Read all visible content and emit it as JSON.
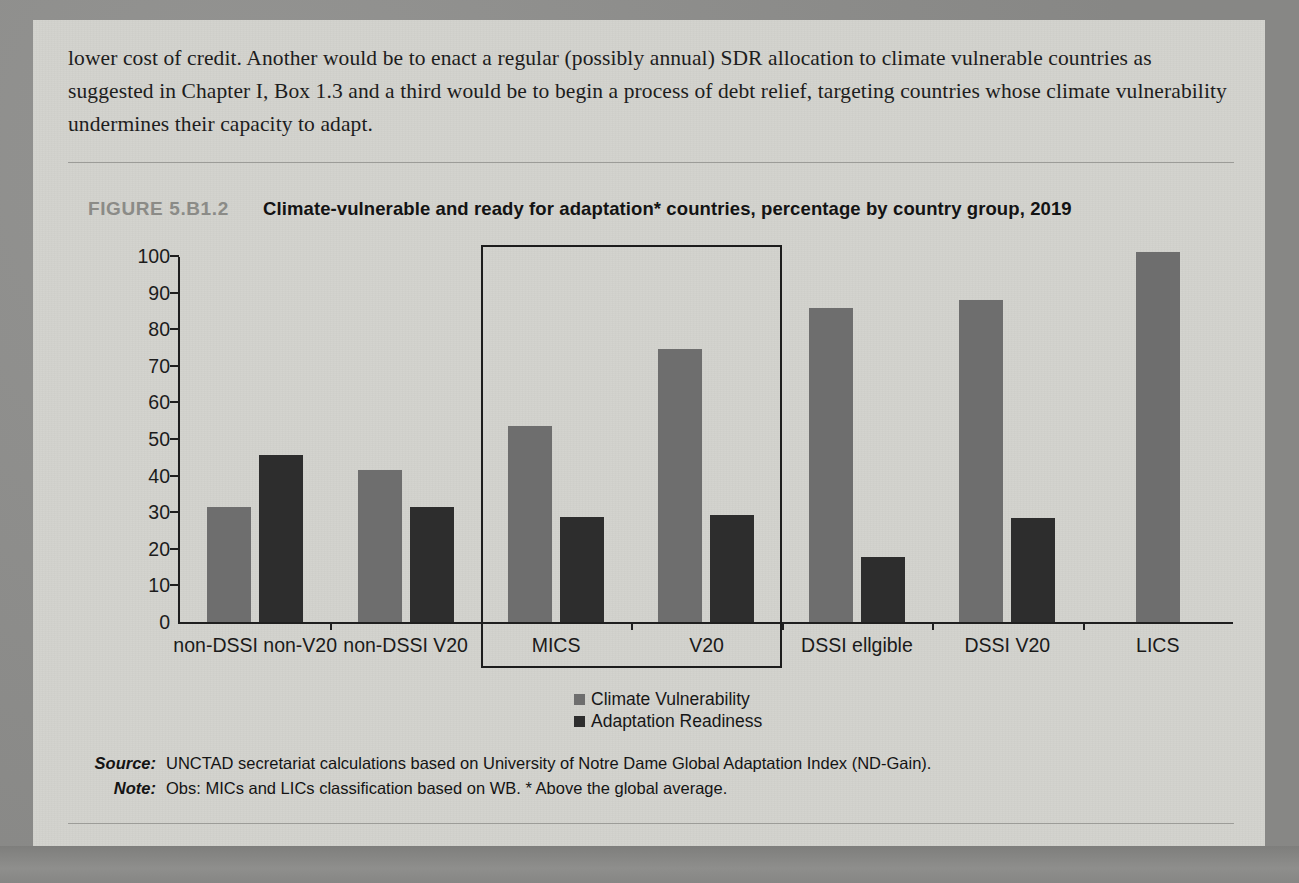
{
  "body_text": "lower cost of credit. Another would be to enact a regular (possibly annual) SDR allocation to climate vulnerable countries as suggested in  Chapter I, Box 1.3 and a third would be to begin a process of debt relief, targeting countries whose climate vulnerability undermines their capacity to adapt.",
  "figure": {
    "number": "FIGURE 5.B1.2",
    "title": "Climate-vulnerable and ready for adaptation* countries, percentage by country group, 2019"
  },
  "notes": {
    "source_label": "Source:",
    "source_text": "UNCTAD secretariat calculations based on University of Notre Dame Global Adaptation Index (ND-Gain).",
    "note_label": "Note:",
    "note_text": "Obs: MICs and LICs classification based on WB. * Above the global average."
  },
  "colors": {
    "climate_vulnerability": "#6e6e6e",
    "adaptation_readiness": "#2d2d2d",
    "axis": "#1f1f1f",
    "paper": "#d2d2cd",
    "figure_number": "#8b8b87"
  },
  "chart_data": {
    "type": "bar",
    "title": "Climate-vulnerable and ready for adaptation* countries, percentage by country group, 2019",
    "xlabel": "",
    "ylabel": "",
    "ylim": [
      0,
      100
    ],
    "yticks": [
      0,
      10,
      20,
      30,
      40,
      50,
      60,
      70,
      80,
      90,
      100
    ],
    "ytick_labels": [
      "0",
      "10",
      "20",
      "30",
      "40",
      "50",
      "60",
      "70",
      "80",
      "90",
      "100"
    ],
    "grid": false,
    "legend_position": "bottom-center",
    "categories": [
      "non-DSSI non-V20",
      "non-DSSI V20",
      "MICS",
      "V20",
      "DSSI ellgible",
      "DSSI V20",
      "LICS"
    ],
    "series": [
      {
        "name": "Climate Vulnerability",
        "color": "#6e6e6e",
        "values": [
          31.5,
          41.6,
          53.5,
          74.5,
          85.8,
          88.0,
          101.0
        ]
      },
      {
        "name": "Adaptation Readiness",
        "color": "#2d2d2d",
        "values": [
          45.5,
          31.3,
          28.8,
          29.2,
          17.8,
          28.5,
          0
        ]
      }
    ],
    "annotations": [
      {
        "type": "highlight-rectangle",
        "covers": [
          "MICS",
          "V20"
        ]
      }
    ]
  }
}
